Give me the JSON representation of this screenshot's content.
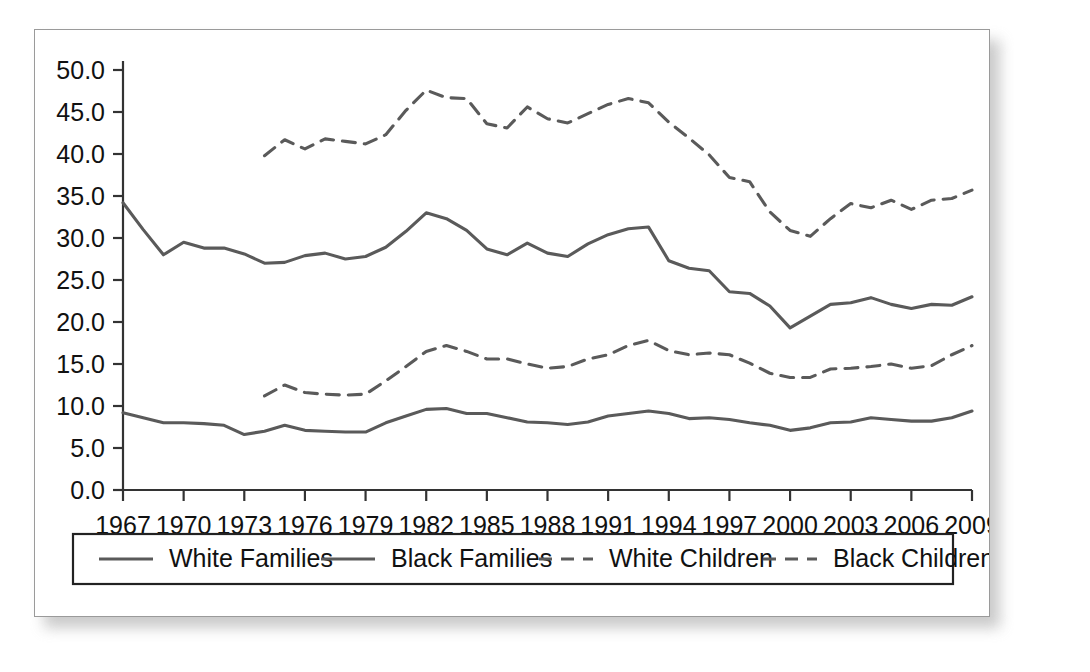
{
  "chart_data": {
    "type": "line",
    "title": "",
    "xlabel": "",
    "ylabel": "",
    "xlim": [
      1967,
      2009
    ],
    "ylim": [
      0.0,
      50.0
    ],
    "grid": false,
    "legend_position": "bottom",
    "y_ticks": [
      "0.0",
      "5.0",
      "10.0",
      "15.0",
      "20.0",
      "25.0",
      "30.0",
      "35.0",
      "40.0",
      "45.0",
      "50.0"
    ],
    "y_tick_values": [
      0.0,
      5.0,
      10.0,
      15.0,
      20.0,
      25.0,
      30.0,
      35.0,
      40.0,
      45.0,
      50.0
    ],
    "x_ticks": [
      "1967",
      "1970",
      "1973",
      "1976",
      "1979",
      "1982",
      "1985",
      "1988",
      "1991",
      "1994",
      "1997",
      "2000",
      "2003",
      "2006",
      "2009"
    ],
    "x_tick_values": [
      1967,
      1970,
      1973,
      1976,
      1979,
      1982,
      1985,
      1988,
      1991,
      1994,
      1997,
      2000,
      2003,
      2006,
      2009
    ],
    "series": [
      {
        "name": "White Families",
        "style": "solid",
        "color": "#5a5a5a",
        "x": [
          1967,
          1968,
          1969,
          1970,
          1971,
          1972,
          1973,
          1974,
          1975,
          1976,
          1977,
          1978,
          1979,
          1980,
          1981,
          1982,
          1983,
          1984,
          1985,
          1986,
          1987,
          1988,
          1989,
          1990,
          1991,
          1992,
          1993,
          1994,
          1995,
          1996,
          1997,
          1998,
          1999,
          2000,
          2001,
          2002,
          2003,
          2004,
          2005,
          2006,
          2007,
          2008,
          2009
        ],
        "values": [
          9.2,
          8.6,
          8.0,
          8.0,
          7.9,
          7.7,
          6.6,
          7.0,
          7.7,
          7.1,
          7.0,
          6.9,
          6.9,
          8.0,
          8.8,
          9.6,
          9.7,
          9.1,
          9.1,
          8.6,
          8.1,
          8.0,
          7.8,
          8.1,
          8.8,
          9.1,
          9.4,
          9.1,
          8.5,
          8.6,
          8.4,
          8.0,
          7.7,
          7.1,
          7.4,
          8.0,
          8.1,
          8.6,
          8.4,
          8.2,
          8.2,
          8.6,
          9.4
        ]
      },
      {
        "name": "Black Families",
        "style": "solid",
        "color": "#5a5a5a",
        "x": [
          1967,
          1968,
          1969,
          1970,
          1971,
          1972,
          1973,
          1974,
          1975,
          1976,
          1977,
          1978,
          1979,
          1980,
          1981,
          1982,
          1983,
          1984,
          1985,
          1986,
          1987,
          1988,
          1989,
          1990,
          1991,
          1992,
          1993,
          1994,
          1995,
          1996,
          1997,
          1998,
          1999,
          2000,
          2001,
          2002,
          2003,
          2004,
          2005,
          2006,
          2007,
          2008,
          2009
        ],
        "values": [
          34.2,
          31.0,
          28.0,
          29.5,
          28.8,
          28.8,
          28.1,
          27.0,
          27.1,
          27.9,
          28.2,
          27.5,
          27.8,
          28.9,
          30.8,
          33.0,
          32.3,
          30.9,
          28.7,
          28.0,
          29.4,
          28.2,
          27.8,
          29.3,
          30.4,
          31.1,
          31.3,
          27.3,
          26.4,
          26.1,
          23.6,
          23.4,
          21.9,
          19.3,
          20.7,
          22.1,
          22.3,
          22.9,
          22.1,
          21.6,
          22.1,
          22.0,
          23.0
        ]
      },
      {
        "name": "White Children",
        "style": "dashed",
        "color": "#5a5a5a",
        "x": [
          1974,
          1975,
          1976,
          1977,
          1978,
          1979,
          1980,
          1981,
          1982,
          1983,
          1984,
          1985,
          1986,
          1987,
          1988,
          1989,
          1990,
          1991,
          1992,
          1993,
          1994,
          1995,
          1996,
          1997,
          1998,
          1999,
          2000,
          2001,
          2002,
          2003,
          2004,
          2005,
          2006,
          2007,
          2008,
          2009
        ],
        "values": [
          11.2,
          12.5,
          11.6,
          11.4,
          11.3,
          11.4,
          13.0,
          14.7,
          16.5,
          17.2,
          16.5,
          15.6,
          15.6,
          15.0,
          14.5,
          14.7,
          15.6,
          16.1,
          17.2,
          17.8,
          16.6,
          16.1,
          16.3,
          16.1,
          15.1,
          13.9,
          13.4,
          13.4,
          14.4,
          14.5,
          14.7,
          15.0,
          14.5,
          14.8,
          16.1,
          17.2
        ]
      },
      {
        "name": "Black Children",
        "style": "dashed",
        "color": "#5a5a5a",
        "x": [
          1974,
          1975,
          1976,
          1977,
          1978,
          1979,
          1980,
          1981,
          1982,
          1983,
          1984,
          1985,
          1986,
          1987,
          1988,
          1989,
          1990,
          1991,
          1992,
          1993,
          1994,
          1995,
          1996,
          1997,
          1998,
          1999,
          2000,
          2001,
          2002,
          2003,
          2004,
          2005,
          2006,
          2007,
          2008,
          2009
        ],
        "values": [
          39.8,
          41.7,
          40.6,
          41.8,
          41.5,
          41.2,
          42.3,
          45.2,
          47.6,
          46.7,
          46.6,
          43.6,
          43.1,
          45.6,
          44.2,
          43.7,
          44.8,
          45.9,
          46.6,
          46.1,
          43.8,
          41.9,
          39.9,
          37.2,
          36.7,
          33.1,
          30.9,
          30.2,
          32.3,
          34.1,
          33.6,
          34.5,
          33.4,
          34.5,
          34.7,
          35.7
        ]
      }
    ],
    "legend_entries": [
      {
        "label": "White Families",
        "style": "solid"
      },
      {
        "label": "Black Families",
        "style": "solid"
      },
      {
        "label": "White Children",
        "style": "dashed"
      },
      {
        "label": "Black Children",
        "style": "dashed"
      }
    ]
  }
}
